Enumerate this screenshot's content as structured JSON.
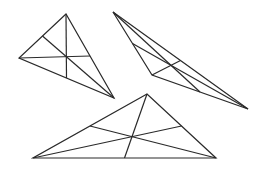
{
  "diagram": {
    "stroke_color": "#2a2a2a",
    "background": "#ffffff",
    "triangles": [
      {
        "name": "triangle-1",
        "vertices": [
          [
            66,
            14
          ],
          [
            19,
            58
          ],
          [
            114,
            98
          ]
        ]
      },
      {
        "name": "triangle-2",
        "vertices": [
          [
            113,
            12
          ],
          [
            152,
            75
          ],
          [
            248,
            109
          ]
        ]
      },
      {
        "name": "triangle-3",
        "vertices": [
          [
            147,
            94
          ],
          [
            33,
            158
          ],
          [
            216,
            158
          ]
        ]
      }
    ]
  }
}
